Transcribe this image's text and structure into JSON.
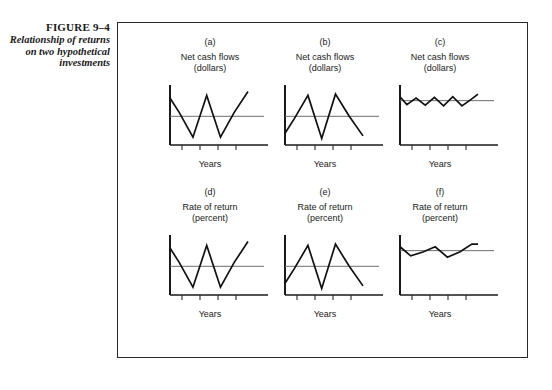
{
  "caption": {
    "figure_number": "FIGURE 9–4",
    "description": "Relationship of returns on two hypothetical investments"
  },
  "chart_data": {
    "type": "line",
    "title": "Relationship of returns on two hypothetical investments",
    "shared": {
      "xlabel": "Years",
      "grid": false,
      "legend": null,
      "xtick_count": 4,
      "xticks": [
        "",
        "",
        "",
        ""
      ],
      "reference_line": "horizontal mean line"
    },
    "panels": [
      {
        "id": "a",
        "label": "(a)",
        "ylabel": "Net cash flows\n(dollars)",
        "xlabel": "Years",
        "pattern": "high-amplitude zigzag, starts high",
        "x": [
          0,
          12,
          30,
          48,
          66,
          84,
          102
        ],
        "y": [
          72,
          50,
          12,
          76,
          12,
          50,
          82
        ],
        "ylim": [
          0,
          92
        ],
        "mean_level": 44
      },
      {
        "id": "b",
        "label": "(b)",
        "ylabel": "Net cash flows\n(dollars)",
        "xlabel": "Years",
        "pattern": "high-amplitude zigzag, starts low (out of phase with a)",
        "x": [
          0,
          12,
          30,
          48,
          66,
          84,
          102
        ],
        "y": [
          18,
          40,
          76,
          10,
          78,
          44,
          14
        ],
        "ylim": [
          0,
          92
        ],
        "mean_level": 44
      },
      {
        "id": "c",
        "label": "(c)",
        "ylabel": "Net cash flows\n(dollars)",
        "xlabel": "Years",
        "pattern": "low-amplitude high-frequency zigzag near mean",
        "x": [
          0,
          9,
          21,
          33,
          45,
          57,
          69,
          81,
          93,
          102
        ],
        "y": [
          74,
          62,
          72,
          61,
          73,
          60,
          74,
          60,
          70,
          78
        ],
        "ylim": [
          0,
          92
        ],
        "mean_level": 68
      },
      {
        "id": "d",
        "label": "(d)",
        "ylabel": "Rate of return\n(percent)",
        "xlabel": "Years",
        "pattern": "high-amplitude zigzag, starts high",
        "x": [
          0,
          12,
          30,
          48,
          66,
          84,
          102
        ],
        "y": [
          72,
          50,
          12,
          76,
          12,
          50,
          82
        ],
        "ylim": [
          0,
          92
        ],
        "mean_level": 44
      },
      {
        "id": "e",
        "label": "(e)",
        "ylabel": "Rate of return\n(percent)",
        "xlabel": "Years",
        "pattern": "high-amplitude zigzag, starts low (out of phase with d)",
        "x": [
          0,
          12,
          30,
          48,
          66,
          84,
          102
        ],
        "y": [
          18,
          40,
          76,
          10,
          78,
          44,
          14
        ],
        "ylim": [
          0,
          92
        ],
        "mean_level": 44
      },
      {
        "id": "f",
        "label": "(f)",
        "ylabel": "Rate of return\n(percent)",
        "xlabel": "Years",
        "pattern": "low-amplitude low-frequency zigzag near mean",
        "x": [
          0,
          14,
          30,
          46,
          62,
          78,
          94,
          102
        ],
        "y": [
          74,
          60,
          66,
          74,
          58,
          66,
          78,
          78
        ],
        "ylim": [
          0,
          92
        ],
        "mean_level": 68
      }
    ]
  }
}
